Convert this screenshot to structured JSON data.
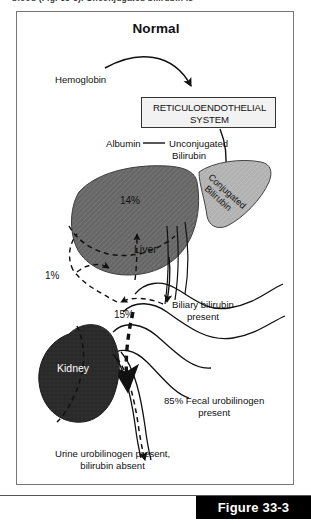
{
  "running_header": {
    "text": "blood (Fig. 33-3). Unconjugated bilirubin is"
  },
  "figure": {
    "title": "Normal",
    "caption": "Figure 33-3"
  },
  "labels": {
    "hemoglobin": "Hemoglobin",
    "res_line1": "RETICULOENDOTHELIAL",
    "res_line2": "SYSTEM",
    "albumin": "Albumin",
    "unconjugated_line1": "Unconjugated",
    "unconjugated_line2": "Bilirubin",
    "conjugated_line1": "Conjugated",
    "conjugated_line2": "Bilirubin",
    "liver": "Liver",
    "kidney": "Kidney",
    "pct_liver": "14%",
    "pct_urine": "1%",
    "pct_enterohepatic": "15%",
    "biliary_line1": "Biliary bilirubin",
    "biliary_line2": "present",
    "fecal_line1": "85% Fecal urobilinogen",
    "fecal_line2": "present",
    "urine_line1": "Urine urobilinogen present,",
    "urine_line2": "bilirubin absent"
  },
  "colors": {
    "liver_fill": "#666666",
    "kidney_fill": "#2b2b2b",
    "gallbladder_fill": "#b2b2b2",
    "res_box_fill": "#f2f2f2",
    "stroke": "#111111",
    "caption_bar": "#000000"
  }
}
